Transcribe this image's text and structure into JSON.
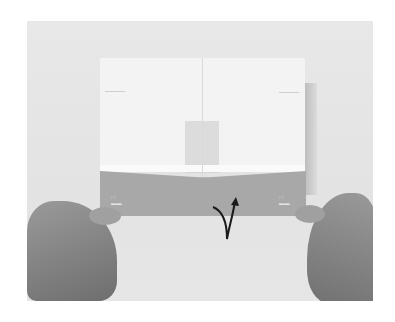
{
  "image": {
    "description": "Photograph of two hands holding a sheet of paper with a folded lower flap; a curved arrow indicates folding the flap up behind",
    "colors": {
      "background": "#e6e6e6",
      "paper": "#f3f3f3",
      "flap": "#a8a8a8",
      "arrow": "#1a1a1a",
      "hands": "#8a8a8a"
    }
  },
  "instructions": {
    "arrow": "fold-behind-arrow"
  }
}
